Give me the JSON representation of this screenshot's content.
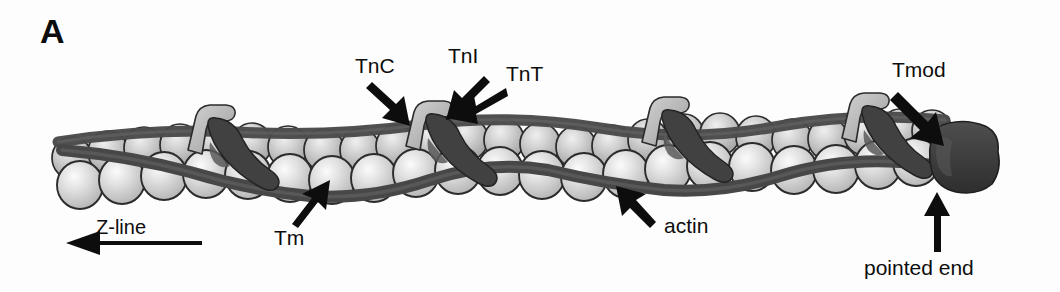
{
  "figure": {
    "panel_label": "A",
    "background_color": "#fdfdfd"
  },
  "annotations": {
    "tnc": "TnC",
    "tni": "TnI",
    "tnt": "TnT",
    "tmod": "Tmod",
    "tm": "Tm",
    "actin": "actin",
    "zline": "Z-line",
    "pointed_end": "pointed end"
  },
  "icons": {
    "tnc_arrow": "arrow-down-right-icon",
    "tni_arrow": "arrow-down-left-icon",
    "tnt_arrow": "arrow-left-down-icon",
    "tmod_arrow": "arrow-down-right-icon",
    "tm_arrow": "arrow-up-right-icon",
    "actin_arrow": "arrow-up-left-icon",
    "pointed_end_arrow": "arrow-up-icon",
    "zline_arrow": "arrow-left-long-icon"
  },
  "colors": {
    "actin_sphere": "#d9d9d9",
    "actin_sphere_highlight": "#f2f2f2",
    "actin_outline": "#2b2b2b",
    "tropomyosin": "#4a4a4a",
    "troponin_dark": "#414141",
    "troponin_light": "#bdbdbd",
    "tmod_cap": "#3a3a3a",
    "text": "#0d0d0d",
    "arrow": "#0d0d0d"
  },
  "structure": {
    "filament_start_x": 55,
    "filament_end_x": 990,
    "troponin_positions_x": [
      200,
      420,
      655,
      855
    ],
    "actin_rows": 2
  }
}
